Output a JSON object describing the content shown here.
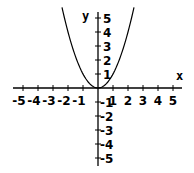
{
  "chart_data": {
    "type": "line",
    "title": "",
    "function": "y = x^2",
    "xlabel": "x",
    "ylabel": "y",
    "xlim": [
      -5.5,
      5.6
    ],
    "ylim": [
      -5.5,
      5.5
    ],
    "grid": false,
    "x_ticks": [
      -5,
      -4,
      -3,
      -2,
      -1,
      1,
      2,
      3,
      4,
      5
    ],
    "x_tick_labels": [
      "-5",
      "-4",
      "-3",
      "-2",
      "-1",
      "1",
      "2",
      "3",
      "4",
      "5"
    ],
    "y_ticks": [
      5,
      4,
      3,
      2,
      1,
      -1,
      -2,
      -3,
      -4,
      -5
    ],
    "y_tick_labels": [
      "5",
      "4",
      "3",
      "2",
      "1",
      "-1",
      "-2",
      "-3",
      "-4",
      "-5"
    ],
    "series": [
      {
        "name": "y = x^2",
        "x": [
          -2.4,
          -2,
          -1.5,
          -1,
          -0.5,
          0,
          0.5,
          1,
          1.5,
          2,
          2.4
        ],
        "y": [
          5.76,
          4,
          2.25,
          1,
          0.25,
          0,
          0.25,
          1,
          2.25,
          4,
          5.76
        ]
      }
    ]
  },
  "colors": {
    "background": "#ffffff",
    "axes": "#000000",
    "curve": "#000000"
  }
}
